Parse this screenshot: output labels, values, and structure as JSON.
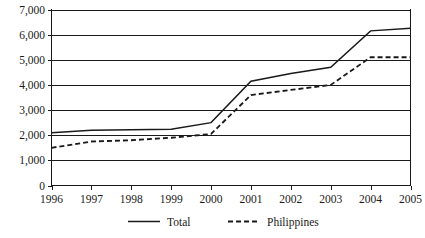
{
  "chart_data": {
    "type": "line",
    "title": "",
    "xlabel": "",
    "ylabel": "",
    "x": [
      1996,
      1997,
      1998,
      1999,
      2000,
      2001,
      2002,
      2003,
      2004,
      2005
    ],
    "categories": [
      "1996",
      "1997",
      "1998",
      "1999",
      "2000",
      "2001",
      "2002",
      "2003",
      "2004",
      "2005"
    ],
    "series": [
      {
        "name": "Total",
        "style": "solid",
        "values": [
          2100,
          2200,
          2220,
          2240,
          2500,
          4150,
          4450,
          4700,
          6150,
          6250
        ]
      },
      {
        "name": "Philippines",
        "style": "dashed",
        "values": [
          1500,
          1750,
          1800,
          1900,
          2050,
          3600,
          3800,
          4000,
          5100,
          5100
        ]
      }
    ],
    "ylim": [
      0,
      7000
    ],
    "ytick_values": [
      0,
      1000,
      2000,
      3000,
      4000,
      5000,
      6000,
      7000
    ],
    "ytick_labels": [
      "0",
      "1,000",
      "2,000",
      "3,000",
      "4,000",
      "5,000",
      "6,000",
      "7,000"
    ],
    "grid": true,
    "grid_axis": "y",
    "legend_position": "bottom",
    "legend_entries": [
      {
        "label": "Total",
        "style": "solid"
      },
      {
        "label": "Philippines",
        "style": "dashed"
      }
    ],
    "line_color": "#1a1a1a",
    "background_color": "#ffffff"
  }
}
